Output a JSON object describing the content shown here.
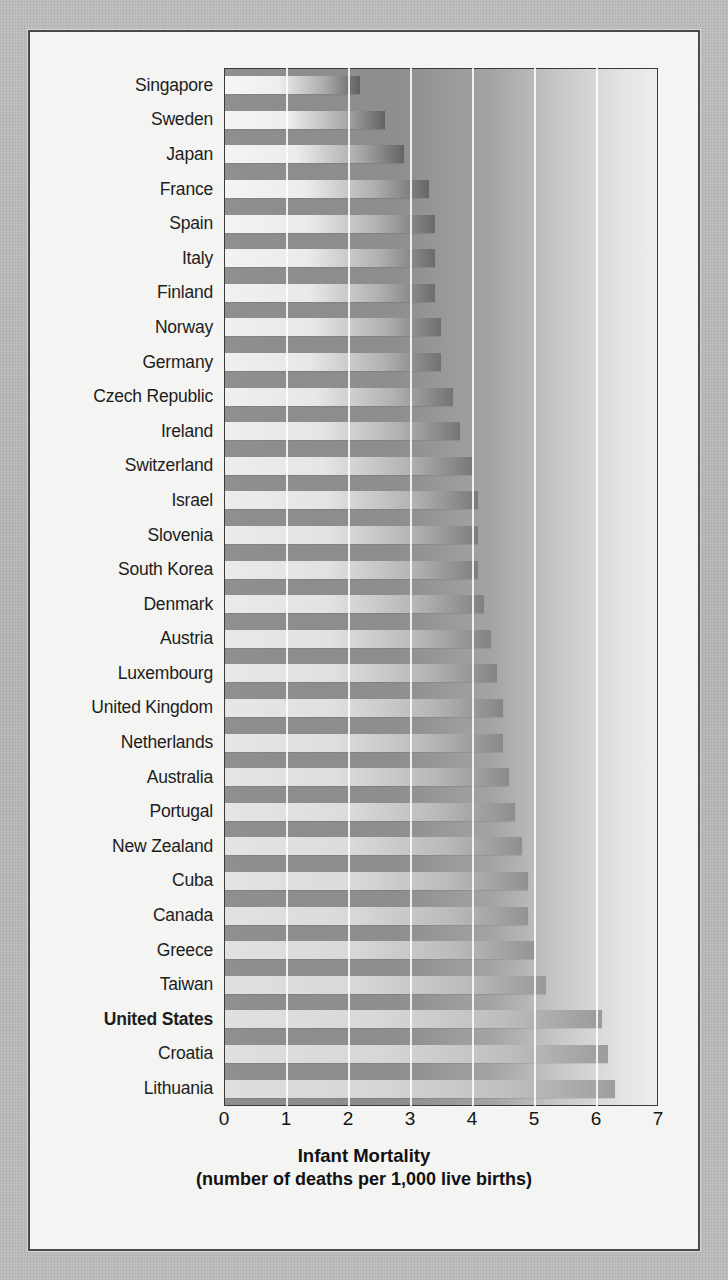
{
  "figure": {
    "axis_title_main": "Infant Mortality",
    "axis_title_sub": "(number of deaths per 1,000 live births)",
    "background_color": "#b9b9b7",
    "card_color": "#f4f4f2",
    "frame_color": "#3a3a3a",
    "gridline_color": "#ffffff"
  },
  "chart_data": {
    "type": "bar",
    "orientation": "horizontal",
    "title": "Infant Mortality",
    "subtitle": "(number of deaths per 1,000 live births)",
    "xlabel": "Infant Mortality (number of deaths per 1,000 live births)",
    "ylabel": "",
    "xlim": [
      0,
      7
    ],
    "xticks": [
      "0",
      "1",
      "2",
      "3",
      "4",
      "5",
      "6",
      "7"
    ],
    "grid": true,
    "legend": "none",
    "highlighted_category": "United States",
    "categories": [
      "Singapore",
      "Sweden",
      "Japan",
      "France",
      "Spain",
      "Italy",
      "Finland",
      "Norway",
      "Germany",
      "Czech Republic",
      "Ireland",
      "Switzerland",
      "Israel",
      "Slovenia",
      "South Korea",
      "Denmark",
      "Austria",
      "Luxembourg",
      "United Kingdom",
      "Netherlands",
      "Australia",
      "Portugal",
      "New Zealand",
      "Cuba",
      "Canada",
      "Greece",
      "Taiwan",
      "United States",
      "Croatia",
      "Lithuania"
    ],
    "values": [
      2.2,
      2.6,
      2.9,
      3.3,
      3.4,
      3.4,
      3.4,
      3.5,
      3.5,
      3.7,
      3.8,
      4.0,
      4.1,
      4.1,
      4.1,
      4.2,
      4.3,
      4.4,
      4.5,
      4.5,
      4.6,
      4.7,
      4.8,
      4.9,
      4.9,
      5.0,
      5.2,
      6.1,
      6.2,
      6.3
    ],
    "bold_rows": [
      "United States"
    ]
  },
  "rows": [
    {
      "label": "Singapore",
      "value": 2.2,
      "bold": false
    },
    {
      "label": "Sweden",
      "value": 2.6,
      "bold": false
    },
    {
      "label": "Japan",
      "value": 2.9,
      "bold": false
    },
    {
      "label": "France",
      "value": 3.3,
      "bold": false
    },
    {
      "label": "Spain",
      "value": 3.4,
      "bold": false
    },
    {
      "label": "Italy",
      "value": 3.4,
      "bold": false
    },
    {
      "label": "Finland",
      "value": 3.4,
      "bold": false
    },
    {
      "label": "Norway",
      "value": 3.5,
      "bold": false
    },
    {
      "label": "Germany",
      "value": 3.5,
      "bold": false
    },
    {
      "label": "Czech Republic",
      "value": 3.7,
      "bold": false
    },
    {
      "label": "Ireland",
      "value": 3.8,
      "bold": false
    },
    {
      "label": "Switzerland",
      "value": 4.0,
      "bold": false
    },
    {
      "label": "Israel",
      "value": 4.1,
      "bold": false
    },
    {
      "label": "Slovenia",
      "value": 4.1,
      "bold": false
    },
    {
      "label": "South Korea",
      "value": 4.1,
      "bold": false
    },
    {
      "label": "Denmark",
      "value": 4.2,
      "bold": false
    },
    {
      "label": "Austria",
      "value": 4.3,
      "bold": false
    },
    {
      "label": "Luxembourg",
      "value": 4.4,
      "bold": false
    },
    {
      "label": "United Kingdom",
      "value": 4.5,
      "bold": false
    },
    {
      "label": "Netherlands",
      "value": 4.5,
      "bold": false
    },
    {
      "label": "Australia",
      "value": 4.6,
      "bold": false
    },
    {
      "label": "Portugal",
      "value": 4.7,
      "bold": false
    },
    {
      "label": "New Zealand",
      "value": 4.8,
      "bold": false
    },
    {
      "label": "Cuba",
      "value": 4.9,
      "bold": false
    },
    {
      "label": "Canada",
      "value": 4.9,
      "bold": false
    },
    {
      "label": "Greece",
      "value": 5.0,
      "bold": false
    },
    {
      "label": "Taiwan",
      "value": 5.2,
      "bold": false
    },
    {
      "label": "United States",
      "value": 6.1,
      "bold": true
    },
    {
      "label": "Croatia",
      "value": 6.2,
      "bold": false
    },
    {
      "label": "Lithuania",
      "value": 6.3,
      "bold": false
    }
  ],
  "xticks": [
    {
      "label": "0",
      "value": 0
    },
    {
      "label": "1",
      "value": 1
    },
    {
      "label": "2",
      "value": 2
    },
    {
      "label": "3",
      "value": 3
    },
    {
      "label": "4",
      "value": 4
    },
    {
      "label": "5",
      "value": 5
    },
    {
      "label": "6",
      "value": 6
    },
    {
      "label": "7",
      "value": 7
    }
  ]
}
